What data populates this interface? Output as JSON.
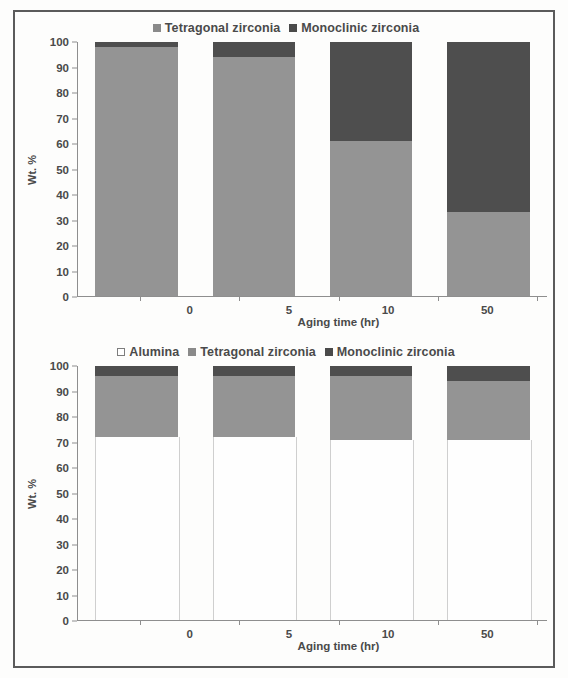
{
  "figure": {
    "ylabel": "Wt. %",
    "xlabel": "Aging time (hr)",
    "yticks": [
      "0",
      "10",
      "20",
      "30",
      "40",
      "50",
      "60",
      "70",
      "80",
      "90",
      "100"
    ],
    "xticklabels": [
      "0",
      "5",
      "10",
      "50"
    ],
    "colors": {
      "alumina": "#ffffff",
      "tetragonal": "#949494",
      "monoclinic": "#4e4e4e",
      "axis": "#8e8e8e",
      "text": "#4a4a4a",
      "frame": "#5b5b5b"
    }
  },
  "top_chart": {
    "legend": [
      {
        "label": "Tetragonal zirconia",
        "swatch": "tetragonal-swatch-icon"
      },
      {
        "label": "Monoclinic zirconia",
        "swatch": "monoclinic-swatch-icon"
      }
    ]
  },
  "bottom_chart": {
    "legend": [
      {
        "label": "Alumina",
        "swatch": "alumina-swatch-icon"
      },
      {
        "label": "Tetragonal zirconia",
        "swatch": "tetragonal-swatch-icon"
      },
      {
        "label": "Monoclinic zirconia",
        "swatch": "monoclinic-swatch-icon"
      }
    ]
  },
  "chart_data": [
    {
      "type": "bar",
      "stacked": true,
      "title": "",
      "xlabel": "Aging time (hr)",
      "ylabel": "Wt. %",
      "ylim": [
        0,
        100
      ],
      "ytick_step": 10,
      "grid": false,
      "legend_position": "top-center",
      "categories": [
        "0",
        "5",
        "10",
        "50"
      ],
      "series": [
        {
          "name": "Tetragonal zirconia",
          "color": "#949494",
          "values": [
            98,
            94,
            61,
            33
          ]
        },
        {
          "name": "Monoclinic zirconia",
          "color": "#4e4e4e",
          "values": [
            2,
            6,
            39,
            67
          ]
        }
      ]
    },
    {
      "type": "bar",
      "stacked": true,
      "title": "",
      "xlabel": "Aging time (hr)",
      "ylabel": "Wt. %",
      "ylim": [
        0,
        100
      ],
      "ytick_step": 10,
      "grid": false,
      "legend_position": "top-center",
      "categories": [
        "0",
        "5",
        "10",
        "50"
      ],
      "series": [
        {
          "name": "Alumina",
          "color": "#ffffff",
          "values": [
            72,
            72,
            71,
            71
          ]
        },
        {
          "name": "Tetragonal zirconia",
          "color": "#949494",
          "values": [
            24,
            24,
            25,
            23
          ]
        },
        {
          "name": "Monoclinic zirconia",
          "color": "#4e4e4e",
          "values": [
            4,
            4,
            4,
            6
          ]
        }
      ]
    }
  ]
}
